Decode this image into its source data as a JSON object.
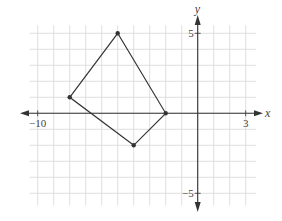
{
  "chart_data": {
    "type": "scatter",
    "title": "",
    "xlabel": "x",
    "ylabel": "y",
    "xlim": [
      -10,
      3
    ],
    "ylim": [
      -5,
      5
    ],
    "grid": true,
    "tick_labels": {
      "x": [
        {
          "value": -10,
          "label": "−10"
        },
        {
          "value": 3,
          "label": "3"
        }
      ],
      "y": [
        {
          "value": 5,
          "label": "5"
        },
        {
          "value": -5,
          "label": "−5"
        }
      ]
    },
    "polygon": {
      "name": "quadrilateral",
      "closed": true,
      "vertices": [
        {
          "x": -5,
          "y": 5
        },
        {
          "x": -2,
          "y": 0
        },
        {
          "x": -4,
          "y": -2
        },
        {
          "x": -8,
          "y": 1
        }
      ]
    }
  },
  "colors": {
    "grid": "#d6d6d6",
    "axis": "#333333",
    "shape": "#333333"
  }
}
